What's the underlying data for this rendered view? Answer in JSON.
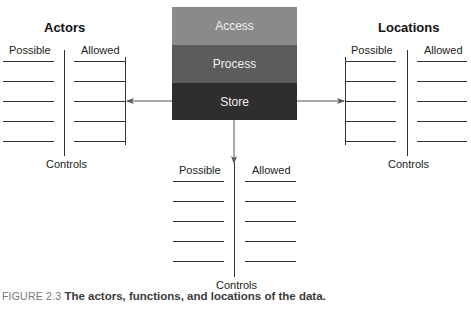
{
  "function_box": {
    "bands": [
      {
        "label": "Access",
        "color": "#8a8a8a"
      },
      {
        "label": "Process",
        "color": "#5c5c5c"
      },
      {
        "label": "Store",
        "color": "#2e2e2e"
      }
    ]
  },
  "groups": {
    "actors": {
      "title": "Actors",
      "possible": "Possible",
      "allowed": "Allowed",
      "controls": "Controls",
      "rows": 5
    },
    "locations": {
      "title": "Locations",
      "possible": "Possible",
      "allowed": "Allowed",
      "controls": "Controls",
      "rows": 5
    },
    "bottom": {
      "possible": "Possible",
      "allowed": "Allowed",
      "controls": "Controls",
      "rows": 5
    }
  },
  "caption": {
    "figure_label": "FIGURE 2.3",
    "text": "The actors, functions, and locations of the data."
  }
}
